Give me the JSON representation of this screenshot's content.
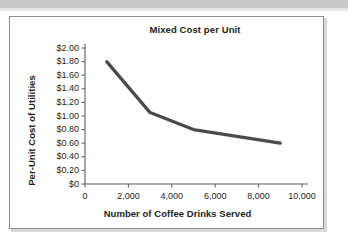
{
  "chart_data": {
    "type": "line",
    "title": "Mixed Cost per Unit",
    "xlabel": "Number of Coffee Drinks Served",
    "ylabel": "Per-Unit Cost of Utilities",
    "x": [
      1000,
      3000,
      5000,
      9000
    ],
    "values": [
      1.8,
      1.05,
      0.8,
      0.6
    ],
    "series": [
      {
        "name": "Per-Unit Cost of Utilities",
        "x": [
          1000,
          3000,
          5000,
          9000
        ],
        "values": [
          1.8,
          1.05,
          0.8,
          0.6
        ]
      }
    ],
    "xlim": [
      0,
      10000
    ],
    "ylim": [
      0,
      2.0
    ],
    "xticks": [
      0,
      2000,
      4000,
      6000,
      8000,
      10000
    ],
    "xtick_labels": [
      "0",
      "2,000",
      "4,000",
      "6,000",
      "8,000",
      "10,000"
    ],
    "yticks": [
      0,
      0.2,
      0.4,
      0.6,
      0.8,
      1.0,
      1.2,
      1.4,
      1.6,
      1.8,
      2.0
    ],
    "ytick_labels": [
      "$0",
      "$0.20",
      "$0.40",
      "$0.60",
      "$0.80",
      "$1.00",
      "$1.20",
      "$1.40",
      "$1.60",
      "$1.80",
      "$2.00"
    ],
    "grid": false,
    "legend": false,
    "legend_position": "none",
    "line_color": "#4a4a4a",
    "axis_color": "#5a5a5a",
    "text_color": "#231f20",
    "background_color": "#ffffff",
    "frame_border_color": "#8d8d8d",
    "top_band_color": "#c9c9c9"
  }
}
